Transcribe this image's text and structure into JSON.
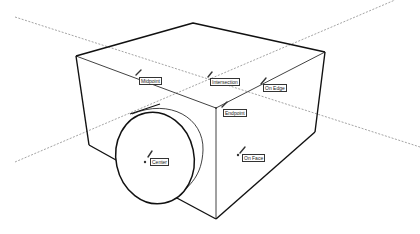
{
  "diagram": {
    "type": "3d-inference-points",
    "inference_labels": [
      {
        "id": "midpoint",
        "text": "Midpoint",
        "x": 139,
        "y": 77
      },
      {
        "id": "intersection",
        "text": "Intersection",
        "x": 210,
        "y": 78
      },
      {
        "id": "on-edge",
        "text": "On Edge",
        "x": 263,
        "y": 84
      },
      {
        "id": "endpoint",
        "text": "Endpoint",
        "x": 223,
        "y": 109
      },
      {
        "id": "center",
        "text": "Center",
        "x": 150,
        "y": 158
      },
      {
        "id": "on-face",
        "text": "On Face",
        "x": 242,
        "y": 154
      }
    ],
    "colors": {
      "edge": "#111111",
      "guide": "#555555",
      "label_border": "#333333"
    }
  }
}
